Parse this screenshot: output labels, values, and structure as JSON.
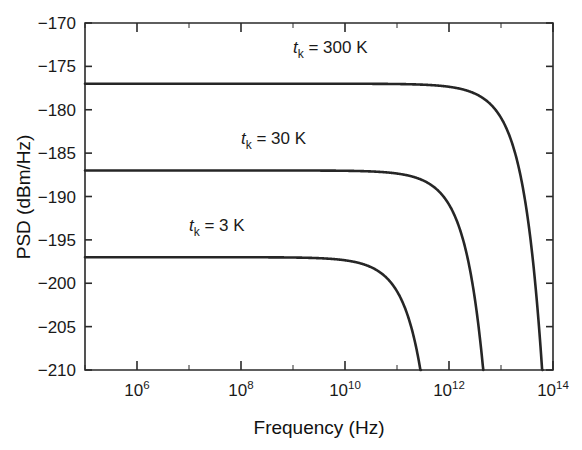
{
  "chart_data": {
    "type": "line",
    "title": "",
    "xlabel": "Frequency (Hz)",
    "ylabel": "PSD (dBm/Hz)",
    "xscale": "log",
    "yscale": "linear",
    "xlim": [
      100000,
      100000000000000
    ],
    "ylim": [
      -210,
      -170
    ],
    "grid": false,
    "legend_position": "inline-annotations",
    "x_tick_labels": [
      "10^6",
      "10^8",
      "10^10",
      "10^12",
      "10^14"
    ],
    "x_tick_mantissas": [
      "10",
      "10",
      "10",
      "10",
      "10"
    ],
    "x_tick_exponents": [
      "6",
      "8",
      "10",
      "12",
      "14"
    ],
    "x_tick_values": [
      1000000,
      100000000,
      10000000000,
      1000000000000,
      100000000000000
    ],
    "y_tick_labels": [
      "−170",
      "−175",
      "−180",
      "−185",
      "−190",
      "−195",
      "−200",
      "−205",
      "−210"
    ],
    "y_tick_values": [
      -170,
      -175,
      -180,
      -185,
      -190,
      -195,
      -200,
      -205,
      -210
    ],
    "series": [
      {
        "name": "tk = 300 K",
        "label_prefix": "t",
        "label_sub": "k",
        "label_suffix": " = 300 K",
        "temperature_K": 300,
        "plateau_dBm_per_Hz": -177,
        "knee_frequency_Hz": 6250000000000,
        "color": "#262626",
        "label_x": 1000000000,
        "label_y": -173.5
      },
      {
        "name": "tk = 30 K",
        "label_prefix": "t",
        "label_sub": "k",
        "label_suffix": " = 30 K",
        "temperature_K": 30,
        "plateau_dBm_per_Hz": -187,
        "knee_frequency_Hz": 625000000000,
        "color": "#262626",
        "label_x": 100000000,
        "label_y": -184.0
      },
      {
        "name": "tk = 3 K",
        "label_prefix": "t",
        "label_sub": "k",
        "label_suffix": " = 3 K",
        "temperature_K": 3,
        "plateau_dBm_per_Hz": -197,
        "knee_frequency_Hz": 62500000000,
        "color": "#262626",
        "label_x": 10000000,
        "label_y": -194.0
      }
    ]
  },
  "figure": {
    "background_color": "#ffffff",
    "axis_color": "#2a2a2a",
    "curve_color": "#262626"
  }
}
